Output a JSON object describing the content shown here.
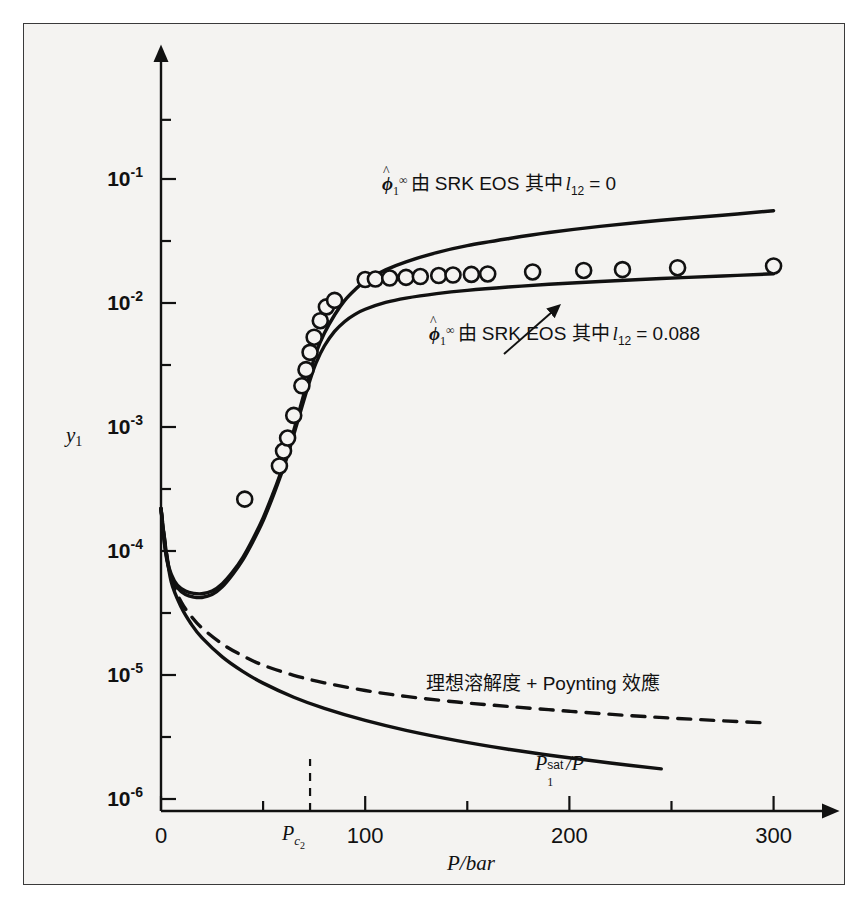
{
  "chart_data": {
    "type": "line",
    "title": "",
    "xlabel": "P/bar",
    "ylabel": "y_1",
    "ylabel_display": "y",
    "ylabel_sub": "1",
    "xlim": [
      0,
      310
    ],
    "ylim_log": [
      1e-06,
      0.3
    ],
    "x_ticks_major": [
      0,
      100,
      200,
      300
    ],
    "x_ticks_major_labels": [
      "0",
      "100",
      "200",
      "300"
    ],
    "x_ticks_minor": [
      50,
      150,
      250
    ],
    "y_ticks_major": [
      0.1,
      0.01,
      0.001,
      0.0001,
      1e-05,
      1e-06
    ],
    "y_ticks_major_labels": [
      "10-1",
      "10-2",
      "10-3",
      "10-4",
      "10-5",
      "10-6"
    ],
    "y_tick_mantissa": "10",
    "y_tick_exponents": [
      "-1",
      "-2",
      "-3",
      "-4",
      "-5",
      "-6"
    ],
    "grid": false,
    "legend_position": "inline-annotations",
    "critical_marker": {
      "label_base": "P",
      "label_sub": "c",
      "label_subsub": "2",
      "x_value": 73,
      "style": "dashed-vertical"
    },
    "series": [
      {
        "name": "phi_hat_1_inf SRK EOS l12 = 0",
        "style": "solid",
        "annotation_base": "ϕ",
        "annotation_hat": true,
        "annotation_sub": "1",
        "annotation_sup": "∞",
        "annotation_text": "由 SRK EOS 其中",
        "annotation_param": "l",
        "annotation_param_sub": "12",
        "annotation_value": "= 0",
        "points": [
          [
            0,
            0.00022
          ],
          [
            1.5,
            0.000125
          ],
          [
            3,
            8.5e-05
          ],
          [
            5,
            6.5e-05
          ],
          [
            8,
            5.3e-05
          ],
          [
            12,
            4.75e-05
          ],
          [
            16,
            4.55e-05
          ],
          [
            20,
            4.52e-05
          ],
          [
            25,
            4.75e-05
          ],
          [
            30,
            5.45e-05
          ],
          [
            35,
            6.75e-05
          ],
          [
            40,
            8.85e-05
          ],
          [
            45,
            0.000125
          ],
          [
            50,
            0.000185
          ],
          [
            55,
            0.000295
          ],
          [
            58,
            0.0004
          ],
          [
            61,
            0.00056
          ],
          [
            64,
            0.00082
          ],
          [
            67,
            0.00122
          ],
          [
            70,
            0.00185
          ],
          [
            73,
            0.00275
          ],
          [
            76,
            0.004
          ],
          [
            80,
            0.0057
          ],
          [
            85,
            0.008
          ],
          [
            90,
            0.0105
          ],
          [
            95,
            0.0128
          ],
          [
            100,
            0.015
          ],
          [
            110,
            0.0185
          ],
          [
            120,
            0.0215
          ],
          [
            135,
            0.0255
          ],
          [
            150,
            0.029
          ],
          [
            170,
            0.033
          ],
          [
            190,
            0.037
          ],
          [
            215,
            0.0415
          ],
          [
            245,
            0.0465
          ],
          [
            275,
            0.051
          ],
          [
            300,
            0.0555
          ]
        ]
      },
      {
        "name": "phi_hat_1_inf SRK EOS l12 = 0.088",
        "style": "solid",
        "annotation_base": "ϕ",
        "annotation_hat": true,
        "annotation_sub": "1",
        "annotation_sup": "∞",
        "annotation_text": "由 SRK EOS 其中",
        "annotation_param": "l",
        "annotation_param_sub": "12",
        "annotation_value": "= 0.088",
        "points": [
          [
            0,
            0.00022
          ],
          [
            1.5,
            0.000122
          ],
          [
            3,
            8.25e-05
          ],
          [
            5,
            6.25e-05
          ],
          [
            8,
            5.05e-05
          ],
          [
            12,
            4.45e-05
          ],
          [
            16,
            4.25e-05
          ],
          [
            20,
            4.22e-05
          ],
          [
            25,
            4.45e-05
          ],
          [
            30,
            5.15e-05
          ],
          [
            35,
            6.45e-05
          ],
          [
            40,
            8.45e-05
          ],
          [
            45,
            0.000119
          ],
          [
            50,
            0.000175
          ],
          [
            55,
            0.00028
          ],
          [
            58,
            0.00038
          ],
          [
            61,
            0.000525
          ],
          [
            64,
            0.00076
          ],
          [
            67,
            0.00112
          ],
          [
            70,
            0.00165
          ],
          [
            73,
            0.0024
          ],
          [
            76,
            0.0033
          ],
          [
            80,
            0.0045
          ],
          [
            85,
            0.0059
          ],
          [
            90,
            0.0071
          ],
          [
            95,
            0.0081
          ],
          [
            100,
            0.0089
          ],
          [
            110,
            0.0101
          ],
          [
            120,
            0.01095
          ],
          [
            135,
            0.0119
          ],
          [
            150,
            0.01265
          ],
          [
            170,
            0.01345
          ],
          [
            190,
            0.01415
          ],
          [
            215,
            0.0149
          ],
          [
            245,
            0.01575
          ],
          [
            275,
            0.0165
          ],
          [
            300,
            0.0172
          ]
        ]
      },
      {
        "name": "ideal solubility + Poynting",
        "style": "dashed",
        "annotation_text": "理想溶解度 + Poynting 效應",
        "points": [
          [
            0,
            0.00022
          ],
          [
            2,
            0.000118
          ],
          [
            5,
            5.95e-05
          ],
          [
            10,
            3.85e-05
          ],
          [
            15,
            2.95e-05
          ],
          [
            20,
            2.4e-05
          ],
          [
            30,
            1.78e-05
          ],
          [
            40,
            1.43e-05
          ],
          [
            50,
            1.2e-05
          ],
          [
            65,
            9.95e-06
          ],
          [
            80,
            8.65e-06
          ],
          [
            100,
            7.5e-06
          ],
          [
            120,
            6.72e-06
          ],
          [
            145,
            6.05e-06
          ],
          [
            170,
            5.58e-06
          ],
          [
            200,
            5.1e-06
          ],
          [
            230,
            4.7e-06
          ],
          [
            260,
            4.4e-06
          ],
          [
            295,
            4.12e-06
          ]
        ]
      },
      {
        "name": "P1sat/P",
        "style": "solid",
        "annotation_base": "P",
        "annotation_sub": "1",
        "annotation_sup": "sat",
        "annotation_value": "/P",
        "points": [
          [
            0,
            0.00022
          ],
          [
            2,
            0.000115
          ],
          [
            5,
            5.65e-05
          ],
          [
            10,
            3.5e-05
          ],
          [
            15,
            2.55e-05
          ],
          [
            20,
            2e-05
          ],
          [
            30,
            1.4e-05
          ],
          [
            40,
            1.07e-05
          ],
          [
            50,
            8.6e-06
          ],
          [
            65,
            6.62e-06
          ],
          [
            80,
            5.38e-06
          ],
          [
            100,
            4.3e-06
          ],
          [
            120,
            3.58e-06
          ],
          [
            145,
            2.96e-06
          ],
          [
            170,
            2.52e-06
          ],
          [
            195,
            2.2e-06
          ],
          [
            220,
            1.95e-06
          ],
          [
            245,
            1.75e-06
          ]
        ]
      }
    ],
    "data_points": {
      "name": "experimental data",
      "marker": "open-circle",
      "values": [
        [
          41,
          0.000262
        ],
        [
          58,
          0.000485
        ],
        [
          60,
          0.00064
        ],
        [
          62,
          0.000815
        ],
        [
          65,
          0.00124
        ],
        [
          69,
          0.00215
        ],
        [
          71,
          0.0029
        ],
        [
          73,
          0.004
        ],
        [
          75,
          0.0053
        ],
        [
          78,
          0.0072
        ],
        [
          81,
          0.0093
        ],
        [
          85,
          0.0105
        ],
        [
          100,
          0.01545
        ],
        [
          105,
          0.0156
        ],
        [
          112,
          0.0159
        ],
        [
          120,
          0.0161
        ],
        [
          127,
          0.01635
        ],
        [
          136,
          0.01665
        ],
        [
          143,
          0.0168
        ],
        [
          152,
          0.017
        ],
        [
          160,
          0.01715
        ],
        [
          182,
          0.0178
        ],
        [
          207,
          0.0183
        ],
        [
          226,
          0.0186
        ],
        [
          253,
          0.01925
        ],
        [
          300,
          0.0199
        ]
      ]
    }
  },
  "figure": {
    "background_color": "#f4f3f1",
    "border_color": "#3a3a3a",
    "ink_color": "#111111"
  }
}
